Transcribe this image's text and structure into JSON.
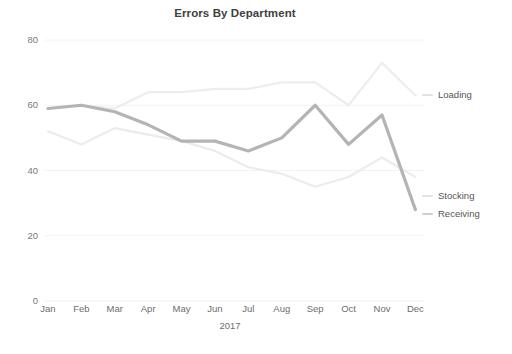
{
  "chart_data": {
    "type": "line",
    "title": "Errors By Department",
    "xlabel": "2017",
    "ylabel": "",
    "categories": [
      "Jan",
      "Feb",
      "Mar",
      "Apr",
      "May",
      "Jun",
      "Jul",
      "Aug",
      "Sep",
      "Oct",
      "Nov",
      "Dec"
    ],
    "ylim": [
      0,
      80
    ],
    "yticks": [
      0,
      20,
      40,
      60,
      80
    ],
    "grid": true,
    "legend_position": "right",
    "series": [
      {
        "name": "Loading",
        "color": "#ededed",
        "values": [
          59,
          60,
          59,
          64,
          64,
          65,
          65,
          67,
          67,
          60,
          73,
          63
        ]
      },
      {
        "name": "Stocking",
        "color": "#ececec",
        "values": [
          52,
          48,
          53,
          51,
          49,
          46,
          41,
          39,
          35,
          38,
          44,
          38
        ]
      },
      {
        "name": "Receiving",
        "color": "#b4b4b4",
        "values": [
          59,
          60,
          58,
          54,
          49,
          49,
          46,
          50,
          60,
          48,
          57,
          28
        ]
      }
    ]
  },
  "legend": {
    "items": [
      {
        "label": "Loading",
        "color": "#e2e2e2"
      },
      {
        "label": "Stocking",
        "color": "#e2e2e2"
      },
      {
        "label": "Receiving",
        "color": "#cfcfcf"
      }
    ]
  },
  "axis": {
    "y_labels": [
      "80",
      "60",
      "40",
      "20",
      "0"
    ],
    "x_labels": [
      "Jan",
      "Feb",
      "Mar",
      "Apr",
      "May",
      "Jun",
      "Jul",
      "Aug",
      "Sep",
      "Oct",
      "Nov",
      "Dec"
    ],
    "x_title": "2017"
  },
  "colors": {
    "background": "#ffffff",
    "grid": "#f2f2f2",
    "axis_text": "#6d6d6d",
    "title_text": "#404040"
  }
}
